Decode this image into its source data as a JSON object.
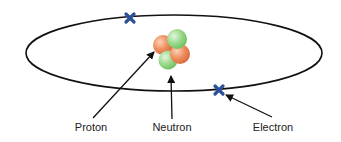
{
  "diagram": {
    "labels": {
      "proton": "Proton",
      "neutron": "Neutron",
      "electron": "Electron"
    },
    "colors": {
      "orbit": "#111111",
      "electron": "#2c4f9a",
      "proton": "#e8875a",
      "neutron": "#8ccf7e",
      "arrow": "#111111",
      "text": "#222222"
    }
  }
}
